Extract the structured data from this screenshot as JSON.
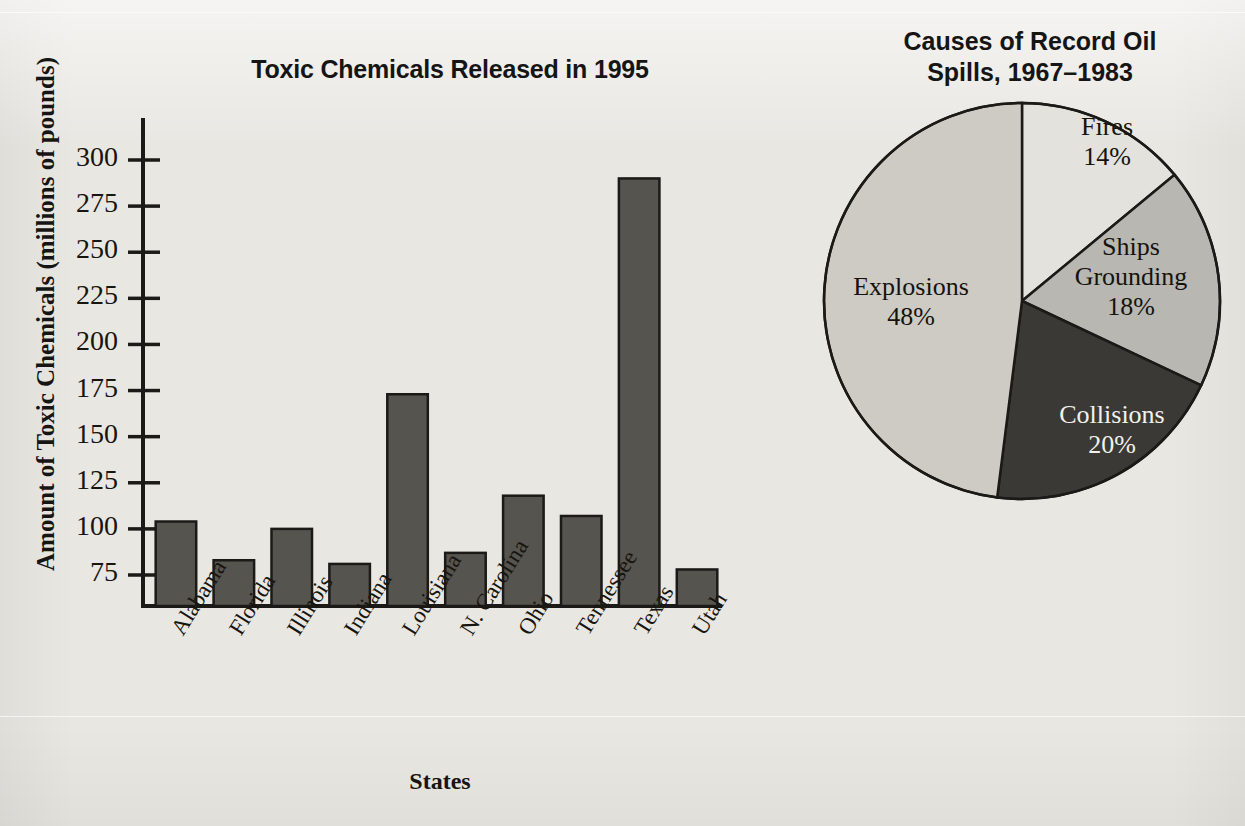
{
  "page": {
    "background_color": "#e9e7e2"
  },
  "bar_panel": {
    "title": "Toxic Chemicals Released in 1995",
    "y_axis_title": "Amount of Toxic Chemicals (millions of pounds)",
    "x_axis_title": "States"
  },
  "pie_panel": {
    "title_line1": "Causes of Record Oil",
    "title_line2": "Spills, 1967–1983"
  },
  "chart_data": [
    {
      "type": "bar",
      "title": "Toxic Chemicals Released in 1995",
      "xlabel": "States",
      "ylabel": "Amount of Toxic Chemicals (millions of pounds)",
      "categories": [
        "Alabama",
        "Florida",
        "Illinois",
        "Indiana",
        "Louisiana",
        "N. Carolina",
        "Ohio",
        "Tennessee",
        "Texas",
        "Utah"
      ],
      "values": [
        104,
        83,
        100,
        81,
        173,
        87,
        118,
        107,
        290,
        78
      ],
      "yticks": [
        75,
        100,
        125,
        150,
        175,
        200,
        225,
        250,
        275,
        300
      ],
      "ytick_labels": [
        "75",
        "100",
        "125",
        "150",
        "175",
        "200",
        "225",
        "250",
        "275",
        "300"
      ],
      "ylim": [
        57,
        318
      ],
      "grid": false,
      "legend": "none",
      "bar_fill_color": "#56544f",
      "bar_edge_color": "#1b1a17",
      "axis_color": "#1b1a17"
    },
    {
      "type": "pie",
      "title": "Causes of Record Oil Spills, 1967–1983",
      "labels": [
        "Fires",
        "Ships Grounding",
        "Collisions",
        "Explosions"
      ],
      "values": [
        14,
        18,
        20,
        48
      ],
      "value_labels": [
        "14%",
        "18%",
        "20%",
        "48%"
      ],
      "slice_colors": [
        "#e4e2dc",
        "#b9b7b1",
        "#3b3935",
        "#cecbc5"
      ],
      "edge_color": "#1b1a17",
      "start_angle_deg": 0,
      "direction": "clockwise",
      "legend": "none",
      "slices": [
        {
          "label": "Fires",
          "percent": 14,
          "percent_label": "14%",
          "color": "#e4e2dc",
          "text_color": "dark"
        },
        {
          "label": "Ships Grounding",
          "percent": 18,
          "percent_label": "18%",
          "color": "#b9b7b1",
          "text_color": "dark"
        },
        {
          "label": "Collisions",
          "percent": 20,
          "percent_label": "20%",
          "color": "#3b3935",
          "text_color": "light"
        },
        {
          "label": "Explosions",
          "percent": 48,
          "percent_label": "48%",
          "color": "#cecbc5",
          "text_color": "dark"
        }
      ]
    }
  ]
}
